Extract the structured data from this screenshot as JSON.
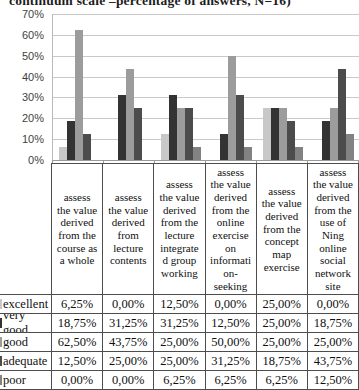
{
  "title": "continuum scale –percentage of answers, N=16)",
  "chart_data": {
    "type": "bar",
    "title": "continuum scale –percentage of answers, N=16)",
    "categories": [
      "assess the value derived from the course as a whole",
      "assess the value derived from lecture contents",
      "assess the value derived from the lecture integrated group working",
      "assess the value derived from the online exercise on information-seeking",
      "assess the value derived from the concept map exercise",
      "assess the value derived from the use of Ning online social network site"
    ],
    "series": [
      {
        "name": "excellent",
        "color": "#c8c8c8",
        "values": [
          6.25,
          0.0,
          12.5,
          0.0,
          25.0,
          0.0
        ]
      },
      {
        "name": "very good",
        "color": "#333333",
        "values": [
          18.75,
          31.25,
          31.25,
          12.5,
          25.0,
          18.75
        ]
      },
      {
        "name": "good",
        "color": "#9c9c9c",
        "values": [
          62.5,
          43.75,
          25.0,
          50.0,
          25.0,
          25.0
        ]
      },
      {
        "name": "adequate",
        "color": "#4c4c4c",
        "values": [
          12.5,
          25.0,
          25.0,
          31.25,
          18.75,
          43.75
        ]
      },
      {
        "name": "poor",
        "color": "#828282",
        "values": [
          0.0,
          0.0,
          6.25,
          6.25,
          6.25,
          12.5
        ]
      }
    ],
    "ylim": [
      0,
      70
    ],
    "ytick_labels": [
      "70%",
      "60%",
      "50%",
      "40%",
      "30%",
      "20%",
      "10%",
      "0%"
    ],
    "grid": true,
    "legend_position": "data-table-row-labels"
  },
  "table": {
    "column_headers_display": [
      "assess\nthe value\nderived\nfrom the\ncourse as\na whole",
      "assess\nthe value\nderived\nfrom\nlecture\ncontents",
      "assess\nthe value\nderived\nfrom the\nlecture\nintegrate\nd group\nworking",
      "assess\nthe value\nderived\nfrom the\nonline\nexercise\non\ninformati\non-\nseeking",
      "assess\nthe value\nderived\nfrom the\nconcept\nmap\nexercise",
      "assess\nthe value\nderived\nfrom the\nuse of\nNing\nonline\nsocial\nnetwork\nsite"
    ],
    "rows": [
      {
        "label": "excellent",
        "values": [
          "6,25%",
          "0,00%",
          "12,50%",
          "0,00%",
          "25,00%",
          "0,00%"
        ]
      },
      {
        "label": "very good",
        "values": [
          "18,75%",
          "31,25%",
          "31,25%",
          "12,50%",
          "25,00%",
          "18,75%"
        ]
      },
      {
        "label": "good",
        "values": [
          "62,50%",
          "43,75%",
          "25,00%",
          "50,00%",
          "25,00%",
          "25,00%"
        ]
      },
      {
        "label": "adequate",
        "values": [
          "12,50%",
          "25,00%",
          "25,00%",
          "31,25%",
          "18,75%",
          "43,75%"
        ]
      },
      {
        "label": "poor",
        "values": [
          "0,00%",
          "0,00%",
          "6,25%",
          "6,25%",
          "6,25%",
          "12,50%"
        ]
      }
    ]
  }
}
